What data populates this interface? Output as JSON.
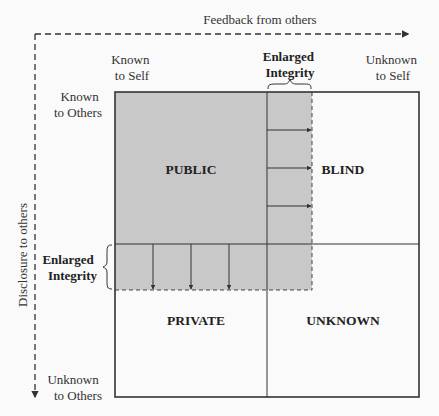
{
  "diagram": {
    "axes": {
      "horizontal_label": "Feedback from others",
      "vertical_label": "Disclosure to others"
    },
    "column_headers": {
      "left": [
        "Known",
        "to Self"
      ],
      "right": [
        "Unknown",
        "to Self"
      ]
    },
    "row_headers": {
      "top": [
        "Known",
        "to Others"
      ],
      "bottom": [
        "Unknown",
        "to Others"
      ]
    },
    "enlargement_labels": {
      "top": [
        "Enlarged",
        "Integrity"
      ],
      "left": [
        "Enlarged",
        "Integrity"
      ]
    },
    "quadrants": {
      "top_left": "PUBLIC",
      "top_right": "BLIND",
      "bottom_left": "PRIVATE",
      "bottom_right": "UNKNOWN"
    },
    "colors": {
      "shaded_area": "#c8c8c8",
      "line": "#333333",
      "background": "#fafafa"
    },
    "expansion_arrows": {
      "rightward_count": 3,
      "downward_count": 3
    }
  }
}
